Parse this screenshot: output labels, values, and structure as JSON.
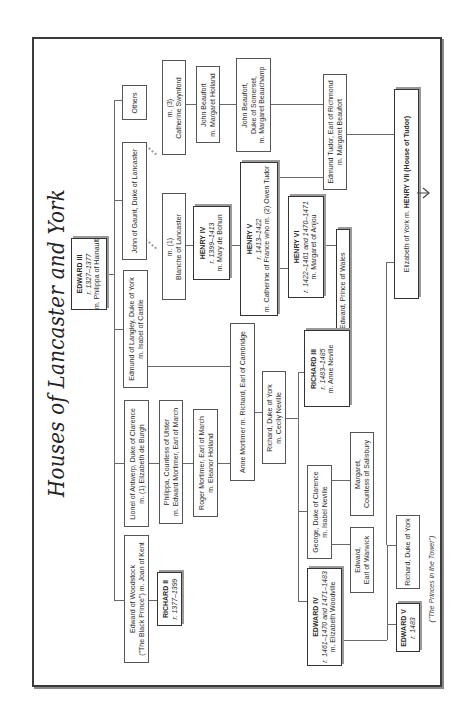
{
  "title": "Houses of Lancaster and York",
  "people": {
    "edward3": {
      "name": "EDWARD III",
      "reign": "r. 1327–1377",
      "spouse": "m. Philippa of Hainault"
    },
    "woodstock": {
      "line1": "Edward of Woodstock",
      "line2": "(\"The Black Prince\") m. Joan of Kent"
    },
    "richard2": {
      "name": "RICHARD II",
      "reign": "r. 1377–1399"
    },
    "lionel": {
      "line1": "Lionel of Antwerp, Duke of Clarence",
      "line2": "m. (1) Elizabeth de Burgh"
    },
    "philippa": {
      "line1": "Philippa, Countess of Ulster",
      "line2": "m. Edward Mortimer, Earl of March"
    },
    "roger": {
      "line1": "Roger Mortimer, Earl of March",
      "line2": "m. Eleanor Holland"
    },
    "edmund_langley": {
      "line1": "Edmund of Langley, Duke of York",
      "line2": "m. Isabel of Castile"
    },
    "anne_mortimer": {
      "line1": "Anne Mortimer m. Richard, Earl of Cambridge"
    },
    "richard_york": {
      "line1": "Richard, Duke of York",
      "line2": "m. Cecily Neville"
    },
    "john_gaunt": {
      "line1": "John of Gaunt, Duke of Lancaster"
    },
    "others": {
      "line1": "Others"
    },
    "blanche": {
      "line1": "m. (1)",
      "line2": "Blanche of Lancaster"
    },
    "catherine": {
      "line1": "m. (3)",
      "line2": "Catherine Swynford"
    },
    "henry4": {
      "name": "HENRY IV",
      "reign": "r. 1399–1413",
      "spouse": "m. Mary de Bohun"
    },
    "henry5": {
      "name": "HENRY V",
      "reign": "r. 1413–1422",
      "spouse": "m. Catherine of France who m. (2) Owen Tudor"
    },
    "henry6": {
      "name": "HENRY VI",
      "reign": "r. 1422–1461 and 1470–1471",
      "spouse": "m. Margaret of Anjou"
    },
    "prince_wales": {
      "line1": "m. (first husband) Edward, Prince of Wales"
    },
    "beaufort1": {
      "line1": "John Beaufort",
      "line2": "m. Margaret Holland"
    },
    "beaufort2": {
      "line1": "John Beaufort,",
      "line2": "Duke of Somerset,",
      "line3": "m. Margaret Beauchamp"
    },
    "edmund_tudor": {
      "line1": "Edmund Tudor, Earl of Richmond",
      "line2": "m. Margaret Beaufort"
    },
    "elizabeth_henry7": {
      "pre": "Elizabeth of York  m. ",
      "name": "HENRY VII (House of Tudor)"
    },
    "richard3": {
      "name": "RICHARD III",
      "reign": "r. 1483–1485",
      "spouse": "m. Anne Neville"
    },
    "george": {
      "line1": "George, Duke of Clarence",
      "line2": "m. Isabel Neville"
    },
    "margaret": {
      "line1": "Margaret,",
      "line2": "Countess of Salisbury"
    },
    "edward_warwick": {
      "line1": "Edward,",
      "line2": "Earl of Warwick"
    },
    "edward4": {
      "name": "EDWARD IV",
      "reign": "r. 1461–1470 and 1471–1483",
      "spouse": "m. Elizabeth Woodville"
    },
    "edward5": {
      "name": "EDWARD V",
      "reign": "r. 1483"
    },
    "richard_york_young": {
      "line1": "Richard, Duke of York"
    },
    "princes_caption": "(\"The Princes in the Tower\")"
  }
}
